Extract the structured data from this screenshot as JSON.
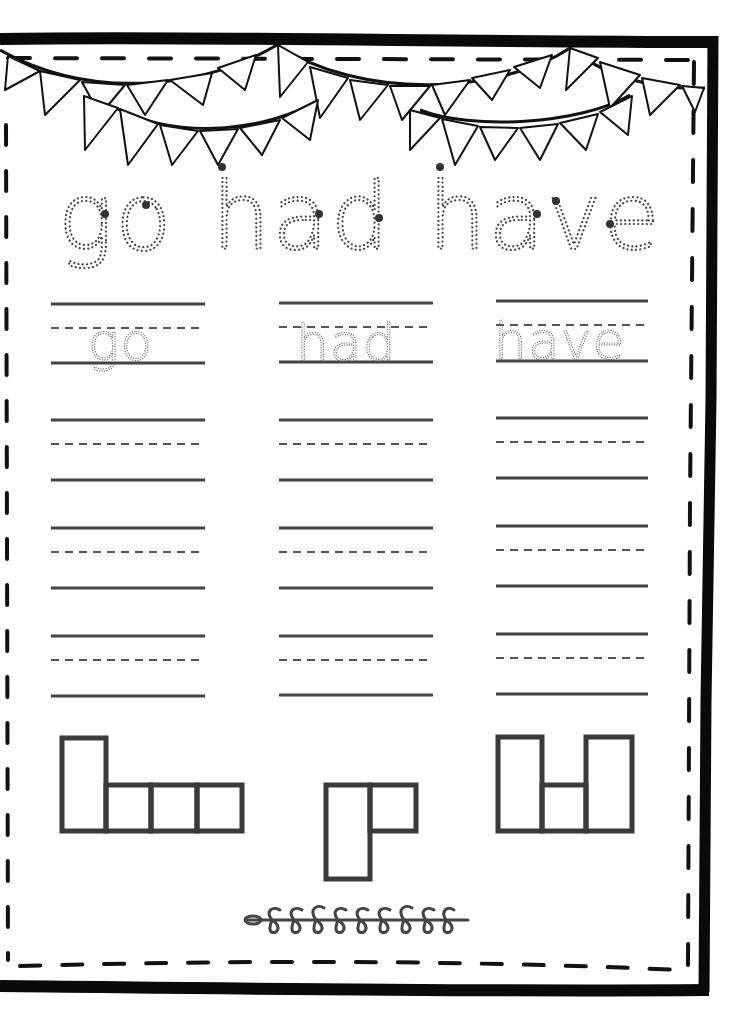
{
  "worksheet": {
    "title_words": [
      "go",
      "had",
      "have"
    ],
    "trace_columns": [
      {
        "word": "go"
      },
      {
        "word": "had"
      },
      {
        "word": "have"
      }
    ],
    "practice_rows_per_column": 3,
    "letter_box_shapes": [
      {
        "word": "have",
        "pattern": [
          "tall",
          "short",
          "short",
          "short"
        ]
      },
      {
        "word": "go",
        "pattern": [
          "descender",
          "short"
        ]
      },
      {
        "word": "had",
        "pattern": [
          "tall",
          "short",
          "tall"
        ]
      }
    ],
    "decorations": {
      "top": "bunting-banner",
      "bottom": "leaf-vine"
    },
    "colors": {
      "frame": "#0a0a0a",
      "lines": "#444444",
      "trace": "#444444",
      "boxes": "#3a3a3a"
    }
  }
}
